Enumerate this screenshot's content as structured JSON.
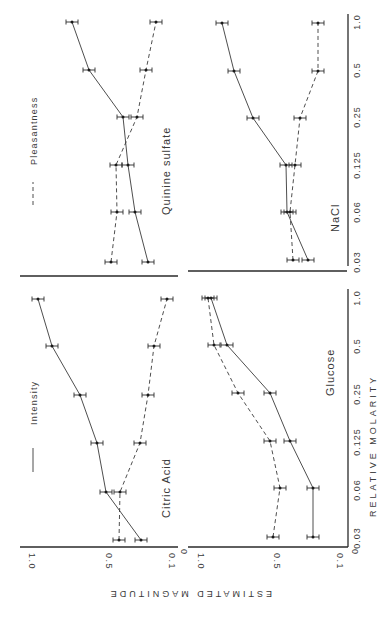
{
  "chart_data": {
    "type": "line",
    "orientation": "rotated-90-clockwise",
    "xlabel": "RELATIVE MOLARITY",
    "ylabel": "ESTIMATED MAGNITUDE",
    "x_ticks": [
      "0.03",
      "0.06",
      "0.125",
      "0.25",
      "0.5",
      "1.0"
    ],
    "y_ticks": [
      "0",
      "0.1",
      "0.5",
      "1.0"
    ],
    "ylim": [
      0,
      1.0
    ],
    "legend": [
      {
        "name": "Intensity",
        "style": "solid"
      },
      {
        "name": "Pleasantness",
        "style": "dashed"
      }
    ],
    "panels": [
      {
        "title": "Citric Acid",
        "categories": [
          "0.03",
          "0.06",
          "0.125",
          "0.25",
          "0.5",
          "1.0"
        ],
        "series": [
          {
            "name": "Intensity",
            "values": [
              0.22,
              0.42,
              0.52,
              0.63,
              0.83,
              0.93
            ]
          },
          {
            "name": "Pleasantness",
            "values": [
              0.35,
              0.35,
              0.22,
              0.19,
              0.16,
              0.07
            ]
          }
        ]
      },
      {
        "title": "Glucose",
        "categories": [
          "0.03",
          "0.06",
          "0.125",
          "0.25",
          "0.5",
          "1.0"
        ],
        "series": [
          {
            "name": "Intensity",
            "values": [
              0.2,
              0.2,
              0.34,
              0.47,
              0.8,
              0.92
            ]
          },
          {
            "name": "Pleasantness",
            "values": [
              0.46,
              0.42,
              0.48,
              0.71,
              0.88,
              0.94
            ]
          }
        ]
      },
      {
        "title": "Quinine sulfate",
        "categories": [
          "0.03",
          "0.06",
          "0.125",
          "0.25",
          "0.5",
          "1.0"
        ],
        "series": [
          {
            "name": "Intensity",
            "values": [
              0.18,
              0.27,
              0.31,
              0.34,
              0.6,
              0.78
            ]
          },
          {
            "name": "Pleasantness",
            "values": [
              0.42,
              0.39,
              0.4,
              0.26,
              0.17,
              0.12
            ]
          }
        ]
      },
      {
        "title": "NaCl",
        "categories": [
          "0.03",
          "0.06",
          "0.125",
          "0.25",
          "0.5",
          "1.0"
        ],
        "series": [
          {
            "name": "Intensity",
            "values": [
              0.23,
              0.38,
              0.38,
              0.62,
              0.76,
              0.9
            ]
          },
          {
            "name": "Pleasantness",
            "values": [
              0.36,
              0.38,
              0.34,
              0.31,
              0.18,
              0.18
            ]
          }
        ]
      }
    ]
  },
  "labels": {
    "xlabel": "RELATIVE MOLARITY",
    "ylabel": "ESTIMATED MAGNITUDE",
    "legend_intensity": "Intensity",
    "legend_pleasantness": "Pleasantness",
    "panel_citric": "Citric Acid",
    "panel_glucose": "Glucose",
    "panel_quinine": "Quinine sulfate",
    "panel_nacl": "NaCl",
    "mag_ticks": [
      "1.0",
      "0.5",
      "0.1",
      "0"
    ],
    "mol_ticks": [
      "0.03",
      "0.06",
      "0.125",
      "0.25",
      "0.5",
      "1.0"
    ]
  },
  "layout_px": {
    "left_panels": {
      "mag_x": {
        "1.0": 25,
        "0.5": 102,
        "0.1": 165,
        "0": 177
      }
    },
    "right_panels": {
      "mag_x": {
        "1.0": 194,
        "0.5": 270,
        "0.1": 333,
        "0": 348
      }
    },
    "top_mol_y": {
      "0.03": 262,
      "0.06": 212,
      "0.125": 165,
      "0.25": 117,
      "0.5": 70,
      "1.0": 22
    },
    "bottom_mol_y": {
      "0.03": 538,
      "0.06": 490,
      "0.125": 442,
      "0.25": 394,
      "0.5": 346,
      "1.0": 298
    }
  },
  "points_px": {
    "quinine": {
      "intensity": [
        [
          148,
          262
        ],
        [
          135,
          212
        ],
        [
          128,
          165
        ],
        [
          123,
          117
        ],
        [
          89,
          70
        ],
        [
          72,
          22
        ]
      ],
      "pleasantness": [
        [
          111,
          262
        ],
        [
          117,
          212
        ],
        [
          116,
          165
        ],
        [
          137,
          117
        ],
        [
          146,
          70
        ],
        [
          156,
          22
        ]
      ]
    },
    "nacl": {
      "intensity": [
        [
          308,
          260
        ],
        [
          287,
          212
        ],
        [
          286,
          165
        ],
        [
          253,
          118
        ],
        [
          234,
          71
        ],
        [
          222,
          23
        ]
      ],
      "pleasantness": [
        [
          293,
          260
        ],
        [
          290,
          212
        ],
        [
          295,
          165
        ],
        [
          300,
          118
        ],
        [
          318,
          71
        ],
        [
          318,
          23
        ]
      ]
    },
    "citric": {
      "intensity": [
        [
          141,
          540
        ],
        [
          106,
          492
        ],
        [
          97,
          443
        ],
        [
          80,
          395
        ],
        [
          52,
          346
        ],
        [
          38,
          299
        ]
      ],
      "pleasantness": [
        [
          119,
          540
        ],
        [
          120,
          492
        ],
        [
          140,
          443
        ],
        [
          148,
          395
        ],
        [
          154,
          346
        ],
        [
          167,
          299
        ]
      ]
    },
    "glucose": {
      "intensity": [
        [
          313,
          537
        ],
        [
          313,
          488
        ],
        [
          290,
          441
        ],
        [
          270,
          393
        ],
        [
          227,
          345
        ],
        [
          211,
          298
        ]
      ],
      "pleasantness": [
        [
          273,
          537
        ],
        [
          280,
          488
        ],
        [
          270,
          441
        ],
        [
          238,
          393
        ],
        [
          214,
          345
        ],
        [
          208,
          298
        ]
      ]
    }
  }
}
